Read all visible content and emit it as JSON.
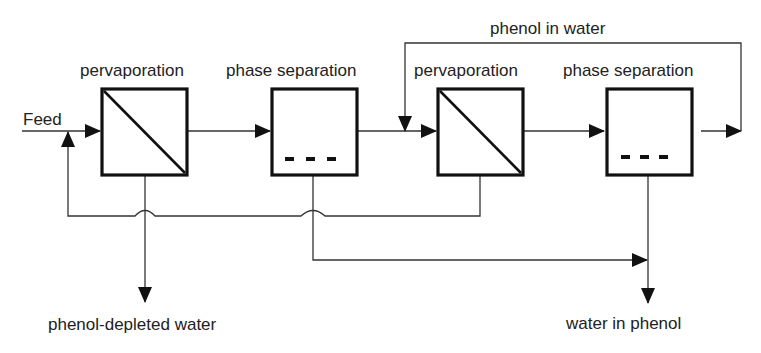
{
  "diagram": {
    "feed_label": "Feed",
    "units": [
      {
        "id": "pv1",
        "label": "pervaporation",
        "type": "pervaporation"
      },
      {
        "id": "ps1",
        "label": "phase separation",
        "type": "phase-separation"
      },
      {
        "id": "pv2",
        "label": "pervaporation",
        "type": "pervaporation"
      },
      {
        "id": "ps2",
        "label": "phase separation",
        "type": "phase-separation"
      }
    ],
    "streams": {
      "recycle_top": "phenol in water",
      "product_left": "phenol-depleted water",
      "product_right": "water in phenol"
    },
    "colors": {
      "line": "#222222",
      "box": "#111111",
      "background": "#ffffff"
    }
  }
}
